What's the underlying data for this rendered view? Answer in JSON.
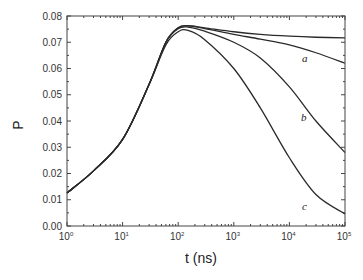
{
  "chart_data": {
    "type": "line",
    "title": "",
    "xlabel": "t (ns)",
    "ylabel": "P",
    "xscale": "log",
    "xlim": [
      1,
      100000
    ],
    "ylim": [
      0.0,
      0.08
    ],
    "grid": false,
    "legend": "none (inline curve labels a, b, c)",
    "x_tick_labels": [
      "10^0",
      "10^1",
      "10^2",
      "10^3",
      "10^4",
      "10^5"
    ],
    "y_tick_labels": [
      "0.00",
      "0.01",
      "0.02",
      "0.03",
      "0.04",
      "0.05",
      "0.06",
      "0.07",
      "0.08"
    ],
    "x": [
      1,
      3,
      10,
      30,
      60,
      100,
      150,
      300,
      1000,
      3000,
      10000,
      30000,
      100000
    ],
    "series": [
      {
        "name": "(top, unlabeled)",
        "values": [
          0.0126,
          0.021,
          0.033,
          0.054,
          0.07,
          0.0755,
          0.0763,
          0.0755,
          0.074,
          0.073,
          0.0723,
          0.0719,
          0.0717
        ]
      },
      {
        "name": "a",
        "values": [
          0.0126,
          0.021,
          0.033,
          0.054,
          0.07,
          0.0755,
          0.0762,
          0.0752,
          0.073,
          0.0712,
          0.069,
          0.066,
          0.062
        ]
      },
      {
        "name": "b",
        "values": [
          0.0126,
          0.021,
          0.033,
          0.054,
          0.07,
          0.0752,
          0.0758,
          0.0742,
          0.07,
          0.064,
          0.053,
          0.04,
          0.028
        ]
      },
      {
        "name": "c",
        "values": [
          0.0126,
          0.021,
          0.033,
          0.054,
          0.069,
          0.074,
          0.0745,
          0.071,
          0.06,
          0.045,
          0.026,
          0.012,
          0.0046
        ]
      }
    ],
    "annotations": [
      {
        "text": "a",
        "x": 20000,
        "y": 0.064
      },
      {
        "text": "b",
        "x": 20000,
        "y": 0.041
      },
      {
        "text": "c",
        "x": 20000,
        "y": 0.007
      }
    ]
  },
  "labels": {
    "xlabel": "t (ns)",
    "ylabel": "P",
    "curve_a": "a",
    "curve_b": "b",
    "curve_c": "c",
    "y_ticks": [
      "0.00",
      "0.01",
      "0.02",
      "0.03",
      "0.04",
      "0.05",
      "0.06",
      "0.07",
      "0.08"
    ],
    "x_ticks_base": "10",
    "x_ticks_exp": [
      "0",
      "1",
      "2",
      "3",
      "4",
      "5"
    ]
  }
}
